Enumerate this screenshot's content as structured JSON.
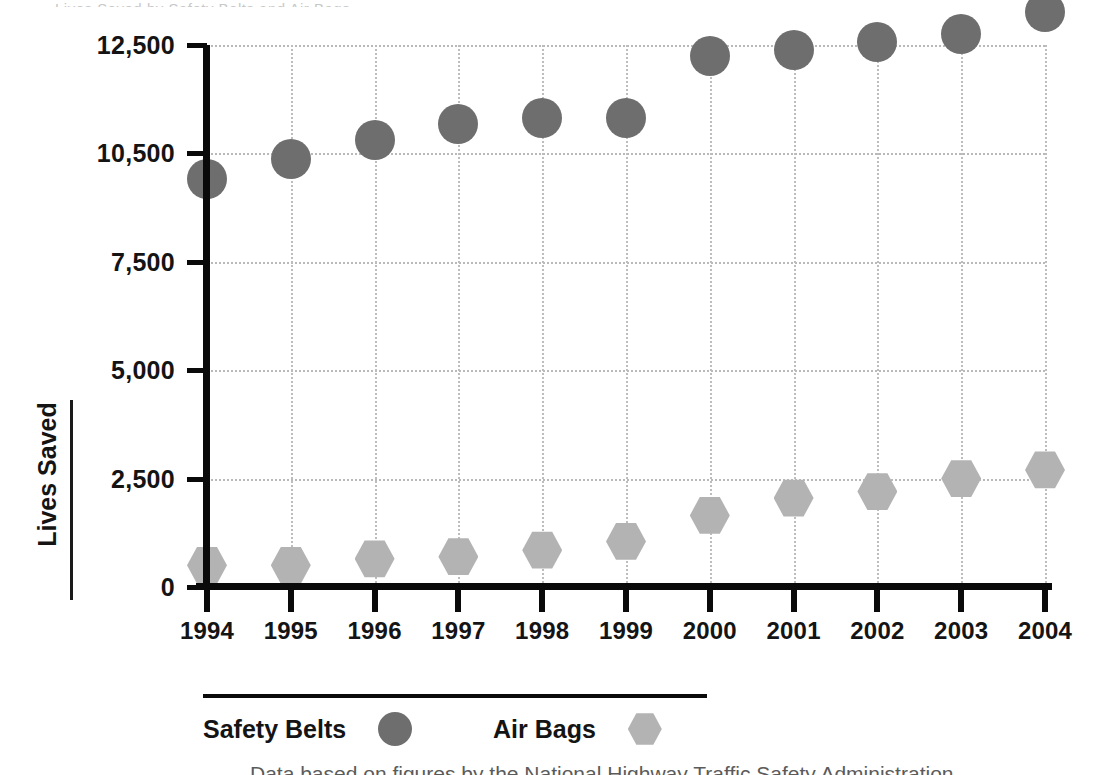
{
  "chart_data": {
    "type": "scatter",
    "title": "",
    "xlabel": "",
    "ylabel": "Lives Saved",
    "categories": [
      "1994",
      "1995",
      "1996",
      "1997",
      "1998",
      "1999",
      "2000",
      "2001",
      "2002",
      "2003",
      "2004"
    ],
    "x_tick_labels": [
      "1994",
      "1995",
      "1996",
      "1997",
      "1998",
      "1999",
      "2000",
      "2001",
      "2002",
      "2003",
      "2004"
    ],
    "y_tick_labels": [
      "0",
      "2,500",
      "5,000",
      "7,500",
      "10,500",
      "12,500"
    ],
    "y_tick_values": [
      0,
      2500,
      5000,
      7500,
      10500,
      12500
    ],
    "ylim": [
      0,
      13500
    ],
    "grid": true,
    "legend_position": "bottom",
    "series": [
      {
        "name": "Safety Belts",
        "marker": "circle",
        "color": "#6e6e6e",
        "values": [
          9800,
          10350,
          10750,
          11050,
          11150,
          11150,
          12300,
          12400,
          12550,
          12700,
          13100
        ]
      },
      {
        "name": "Air Bags",
        "marker": "hexagon",
        "color": "#b3b3b3",
        "values": [
          500,
          500,
          650,
          700,
          850,
          1050,
          1650,
          2050,
          2200,
          2500,
          2700
        ]
      }
    ]
  },
  "legend": {
    "entries": [
      {
        "label": "Safety Belts",
        "marker": "circle",
        "color": "#6e6e6e"
      },
      {
        "label": "Air Bags",
        "marker": "hexagon",
        "color": "#b3b3b3"
      }
    ]
  },
  "caption": {
    "text": "Data based on figures by the National Highway Traffic Safety Administration"
  },
  "scan_artifact": {
    "text": "Lives Saved by Safety Belts and Air Bags"
  }
}
